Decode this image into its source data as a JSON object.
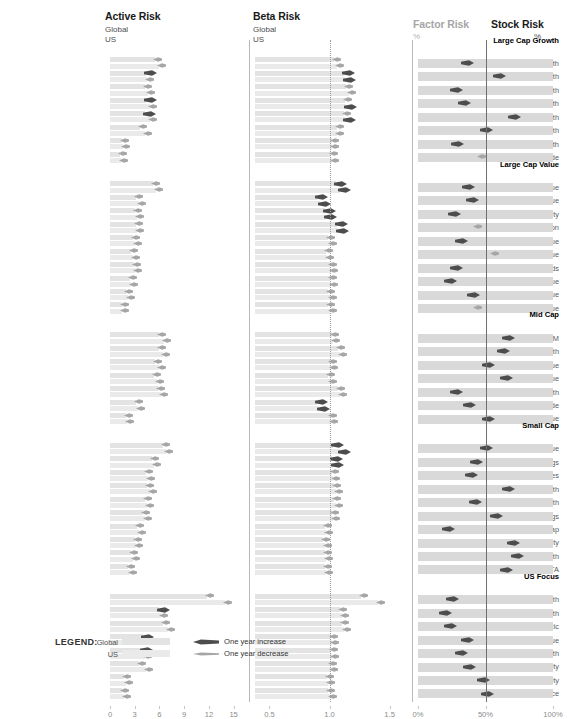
{
  "panels": {
    "active": {
      "title": "Active Risk",
      "sub1": "Global",
      "sub2": "US",
      "ticks": [
        "0",
        "3",
        "6",
        "9",
        "12",
        "15"
      ],
      "min": 0,
      "max": 16.5
    },
    "beta": {
      "title": "Beta Risk",
      "sub1": "Global",
      "sub2": "US",
      "ticks": [
        "0.5",
        "1.0",
        "1.5"
      ],
      "min": 0.38,
      "max": 1.62,
      "refline": 1.0
    },
    "factor": {
      "title": "Factor Risk",
      "sub1": "%"
    },
    "stock": {
      "title": "Stock Risk",
      "sub1": "%",
      "ticks": [
        "0%",
        "50%",
        "100%"
      ]
    }
  },
  "legend": {
    "title": "LEGEND:",
    "global_label": "Global",
    "us_label": "US",
    "increase_label": "One year increase",
    "decrease_label": "One year decrease"
  },
  "colors": {
    "global_bar": "#e3e3e3",
    "us_bar": "#eaeaea",
    "full_bar": "#d9d9d9",
    "increase_marker": "#4d4d4d",
    "decrease_marker": "#a6a6a6",
    "axis": "#8c8c8c"
  },
  "chart_data": {
    "type": "bar",
    "xlabel": "",
    "ylabel": "",
    "axes": [
      {
        "name": "Active Risk",
        "ticks": [
          0,
          3,
          6,
          9,
          12,
          15
        ],
        "range": [
          0,
          16.5
        ],
        "unit": ""
      },
      {
        "name": "Beta Risk",
        "ticks": [
          0.5,
          1.0,
          1.5
        ],
        "range": [
          0.38,
          1.62
        ],
        "unit": "",
        "refline": 1.0
      },
      {
        "name": "Factor Risk / Stock Risk",
        "ticks": [
          0,
          50,
          100
        ],
        "range": [
          0,
          100
        ],
        "unit": "%",
        "split": 50
      }
    ],
    "groups": [
      {
        "name": "Large Cap Growth",
        "rows": [
          {
            "label": "LM Growth",
            "active_global": 5.5,
            "active_us": 5.9,
            "active_g_dir": "dec",
            "active_u_dir": "dec",
            "beta_global": 1.04,
            "beta_us": 1.06,
            "beta_g_dir": "dec",
            "beta_u_dir": "dec",
            "factor": 64,
            "factor_dir": "inc"
          },
          {
            "label": "Controlled US Growth",
            "active_global": 4.4,
            "active_us": 4.5,
            "active_g_dir": "inc",
            "active_u_dir": "dec",
            "beta_global": 1.12,
            "beta_us": 1.13,
            "beta_g_dir": "inc",
            "beta_u_dir": "inc",
            "factor": 40,
            "factor_dir": "inc"
          },
          {
            "label": "Pragmatic Growth",
            "active_global": 4.3,
            "active_us": 4.6,
            "active_g_dir": "dec",
            "active_u_dir": "dec",
            "beta_global": 1.14,
            "beta_us": 1.16,
            "beta_g_dir": "dec",
            "beta_u_dir": "dec",
            "factor": 72,
            "factor_dir": "inc"
          },
          {
            "label": "Merit Growth",
            "active_global": 4.4,
            "active_us": 4.9,
            "active_g_dir": "inc",
            "active_u_dir": "dec",
            "beta_global": 1.13,
            "beta_us": 1.14,
            "beta_g_dir": "dec",
            "beta_u_dir": "inc",
            "factor": 66,
            "factor_dir": "inc"
          },
          {
            "label": "Varied Growth",
            "active_global": 4.3,
            "active_us": 4.8,
            "active_g_dir": "inc",
            "active_u_dir": "dec",
            "beta_global": 1.12,
            "beta_us": 1.13,
            "beta_g_dir": "dec",
            "beta_u_dir": "inc",
            "factor": 29,
            "factor_dir": "inc"
          },
          {
            "label": "Tactical Growth",
            "active_global": 3.7,
            "active_us": 4.3,
            "active_g_dir": "dec",
            "active_u_dir": "dec",
            "beta_global": 1.06,
            "beta_us": 1.06,
            "beta_g_dir": "dec",
            "beta_u_dir": "dec",
            "factor": 50,
            "factor_dir": "inc"
          },
          {
            "label": "Active Growth",
            "active_global": 1.5,
            "active_us": 1.6,
            "active_g_dir": "dec",
            "active_u_dir": "dec",
            "beta_global": 1.02,
            "beta_us": 1.02,
            "beta_g_dir": "dec",
            "beta_u_dir": "dec",
            "factor": 71,
            "factor_dir": "inc"
          },
          {
            "label": "Growth Longitude",
            "active_global": 1.2,
            "active_us": 1.3,
            "active_g_dir": "dec",
            "active_u_dir": "dec",
            "beta_global": 1.01,
            "beta_us": 1.02,
            "beta_g_dir": "dec",
            "beta_u_dir": "dec",
            "factor": 52,
            "factor_dir": "dec"
          }
        ]
      },
      {
        "name": "Large Cap Value",
        "rows": [
          {
            "label": "Merit Value",
            "active_global": 5.2,
            "active_us": 5.6,
            "active_g_dir": "dec",
            "active_u_dir": "dec",
            "beta_global": 1.05,
            "beta_us": 1.09,
            "beta_g_dir": "inc",
            "beta_u_dir": "inc",
            "factor": 63,
            "factor_dir": "inc"
          },
          {
            "label": "Varied Core/Value",
            "active_global": 3.2,
            "active_us": 3.5,
            "active_g_dir": "dec",
            "active_u_dir": "dec",
            "beta_global": 0.9,
            "beta_us": 0.92,
            "beta_g_dir": "inc",
            "beta_u_dir": "inc",
            "factor": 60,
            "factor_dir": "inc"
          },
          {
            "label": "Merit Equity",
            "active_global": 3.0,
            "active_us": 3.3,
            "active_g_dir": "dec",
            "active_u_dir": "dec",
            "beta_global": 0.96,
            "beta_us": 0.97,
            "beta_g_dir": "inc",
            "beta_u_dir": "inc",
            "factor": 73,
            "factor_dir": "inc"
          },
          {
            "label": "DG Capital Appreciation",
            "active_global": 3.1,
            "active_us": 3.3,
            "active_g_dir": "dec",
            "active_u_dir": "dec",
            "beta_global": 1.06,
            "beta_us": 1.07,
            "beta_g_dir": "inc",
            "beta_u_dir": "inc",
            "factor": 55,
            "factor_dir": "dec"
          },
          {
            "label": "Pragmatic Value",
            "active_global": 2.8,
            "active_us": 3.0,
            "active_g_dir": "dec",
            "active_u_dir": "dec",
            "beta_global": 0.99,
            "beta_us": 1.0,
            "beta_g_dir": "dec",
            "beta_u_dir": "dec",
            "factor": 68,
            "factor_dir": "inc"
          },
          {
            "label": "Value",
            "active_global": 2.6,
            "active_us": 2.8,
            "active_g_dir": "dec",
            "active_u_dir": "dec",
            "beta_global": 0.97,
            "beta_us": 0.98,
            "beta_g_dir": "dec",
            "beta_u_dir": "dec",
            "factor": 42,
            "factor_dir": "dec"
          },
          {
            "label": "Value - Dividends",
            "active_global": 2.9,
            "active_us": 3.0,
            "active_g_dir": "dec",
            "active_u_dir": "dec",
            "beta_global": 1.0,
            "beta_us": 1.01,
            "beta_g_dir": "dec",
            "beta_u_dir": "dec",
            "factor": 72,
            "factor_dir": "inc"
          },
          {
            "label": "DG Value",
            "active_global": 2.4,
            "active_us": 2.6,
            "active_g_dir": "dec",
            "active_u_dir": "dec",
            "beta_global": 1.0,
            "beta_us": 1.01,
            "beta_g_dir": "dec",
            "beta_u_dir": "dec",
            "factor": 76,
            "factor_dir": "inc"
          },
          {
            "label": "Controlled US Value",
            "active_global": 2.0,
            "active_us": 2.2,
            "active_g_dir": "dec",
            "active_u_dir": "dec",
            "beta_global": 0.99,
            "beta_us": 1.0,
            "beta_g_dir": "dec",
            "beta_u_dir": "dec",
            "factor": 59,
            "factor_dir": "inc"
          },
          {
            "label": "DG Basic Value",
            "active_global": 1.4,
            "active_us": 1.5,
            "active_g_dir": "dec",
            "active_u_dir": "dec",
            "beta_global": 0.99,
            "beta_us": 1.0,
            "beta_g_dir": "dec",
            "beta_u_dir": "dec",
            "factor": 55,
            "factor_dir": "dec"
          }
        ]
      },
      {
        "name": "Mid Cap",
        "rows": [
          {
            "label": "Mid Cap OM",
            "active_global": 6.0,
            "active_us": 6.5,
            "active_g_dir": "dec",
            "active_u_dir": "dec",
            "beta_global": 1.02,
            "beta_us": 1.03,
            "beta_g_dir": "dec",
            "beta_u_dir": "dec",
            "factor": 33,
            "factor_dir": "inc"
          },
          {
            "label": "Select Mid Cap Growth",
            "active_global": 6.0,
            "active_us": 6.4,
            "active_g_dir": "dec",
            "active_u_dir": "dec",
            "beta_global": 1.07,
            "beta_us": 1.09,
            "beta_g_dir": "dec",
            "beta_u_dir": "dec",
            "factor": 37,
            "factor_dir": "inc"
          },
          {
            "label": "Mid Cap Value",
            "active_global": 5.5,
            "active_us": 5.9,
            "active_g_dir": "dec",
            "active_u_dir": "dec",
            "beta_global": 1.0,
            "beta_us": 1.01,
            "beta_g_dir": "dec",
            "beta_u_dir": "dec",
            "factor": 48,
            "factor_dir": "inc"
          },
          {
            "label": "Select Mid Cap Value",
            "active_global": 5.3,
            "active_us": 5.7,
            "active_g_dir": "dec",
            "active_u_dir": "dec",
            "beta_global": 0.99,
            "beta_us": 1.0,
            "beta_g_dir": "dec",
            "beta_u_dir": "dec",
            "factor": 35,
            "factor_dir": "inc"
          },
          {
            "label": "Mid Cap Growth",
            "active_global": 5.8,
            "active_us": 6.2,
            "active_g_dir": "dec",
            "active_u_dir": "dec",
            "beta_global": 1.07,
            "beta_us": 1.09,
            "beta_g_dir": "dec",
            "beta_u_dir": "dec",
            "factor": 72,
            "factor_dir": "inc"
          },
          {
            "label": "Mid Cap Growth Longitude",
            "active_global": 3.2,
            "active_us": 3.4,
            "active_g_dir": "dec",
            "active_u_dir": "dec",
            "beta_global": 0.9,
            "beta_us": 0.91,
            "beta_g_dir": "inc",
            "beta_u_dir": "inc",
            "factor": 62,
            "factor_dir": "inc"
          },
          {
            "label": "MG Cap Value",
            "active_global": 2.0,
            "active_us": 2.1,
            "active_g_dir": "dec",
            "active_u_dir": "dec",
            "beta_global": 1.0,
            "beta_us": 1.01,
            "beta_g_dir": "dec",
            "beta_u_dir": "dec",
            "factor": 48,
            "factor_dir": "inc"
          }
        ]
      },
      {
        "name": "Small Cap",
        "rows": [
          {
            "label": "Small Cap Value",
            "active_global": 6.4,
            "active_us": 6.8,
            "active_g_dir": "dec",
            "active_u_dir": "dec",
            "beta_global": 1.03,
            "beta_us": 1.09,
            "beta_g_dir": "inc",
            "beta_u_dir": "inc",
            "factor": 50,
            "factor_dir": "inc"
          },
          {
            "label": "Small Cap Openings",
            "active_global": 5.1,
            "active_us": 5.3,
            "active_g_dir": "dec",
            "active_u_dir": "dec",
            "beta_global": 1.02,
            "beta_us": 1.03,
            "beta_g_dir": "inc",
            "beta_u_dir": "inc",
            "factor": 57,
            "factor_dir": "inc"
          },
          {
            "label": "Emerging Companies",
            "active_global": 4.4,
            "active_us": 4.6,
            "active_g_dir": "dec",
            "active_u_dir": "dec",
            "beta_global": 1.02,
            "beta_us": 1.03,
            "beta_g_dir": "dec",
            "beta_u_dir": "dec",
            "factor": 61,
            "factor_dir": "inc"
          },
          {
            "label": "Small Cap Growth",
            "active_global": 4.5,
            "active_us": 4.8,
            "active_g_dir": "dec",
            "active_u_dir": "dec",
            "beta_global": 1.04,
            "beta_us": 1.05,
            "beta_g_dir": "dec",
            "beta_u_dir": "dec",
            "factor": 33,
            "factor_dir": "inc"
          },
          {
            "label": "Select Small Cap Growth",
            "active_global": 4.3,
            "active_us": 4.5,
            "active_g_dir": "dec",
            "active_u_dir": "dec",
            "beta_global": 1.04,
            "beta_us": 1.05,
            "beta_g_dir": "dec",
            "beta_u_dir": "dec",
            "factor": 58,
            "factor_dir": "inc"
          },
          {
            "label": "Small Cap Openings",
            "active_global": 4.0,
            "active_us": 4.2,
            "active_g_dir": "dec",
            "active_u_dir": "dec",
            "beta_global": 1.02,
            "beta_us": 1.03,
            "beta_g_dir": "dec",
            "beta_u_dir": "dec",
            "factor": 42,
            "factor_dir": "inc"
          },
          {
            "label": "SW Micro Cap",
            "active_global": 3.3,
            "active_us": 3.5,
            "active_g_dir": "dec",
            "active_u_dir": "dec",
            "beta_global": 0.96,
            "beta_us": 0.97,
            "beta_g_dir": "dec",
            "beta_u_dir": "dec",
            "factor": 78,
            "factor_dir": "inc"
          },
          {
            "label": "Controlled Small Cap Equity",
            "active_global": 3.0,
            "active_us": 3.2,
            "active_g_dir": "dec",
            "active_u_dir": "dec",
            "beta_global": 0.95,
            "beta_us": 0.96,
            "beta_g_dir": "dec",
            "beta_u_dir": "dec",
            "factor": 30,
            "factor_dir": "inc"
          },
          {
            "label": "US Small Cap Growth",
            "active_global": 2.6,
            "active_us": 2.8,
            "active_g_dir": "dec",
            "active_u_dir": "dec",
            "beta_global": 0.96,
            "beta_us": 0.97,
            "beta_g_dir": "dec",
            "beta_u_dir": "dec",
            "factor": 27,
            "factor_dir": "inc"
          },
          {
            "label": "US Smaller Cap TA",
            "active_global": 2.2,
            "active_us": 2.4,
            "active_g_dir": "dec",
            "active_u_dir": "dec",
            "beta_global": 0.96,
            "beta_us": 0.97,
            "beta_g_dir": "dec",
            "beta_u_dir": "dec",
            "factor": 35,
            "factor_dir": "inc"
          }
        ]
      },
      {
        "name": "US Focus",
        "rows": [
          {
            "label": "Choice Growth",
            "active_global": 11.8,
            "active_us": 14.0,
            "active_g_dir": "dec",
            "active_u_dir": "dec",
            "beta_global": 1.26,
            "beta_us": 1.4,
            "beta_g_dir": "dec",
            "beta_u_dir": "dec",
            "factor": 75,
            "factor_dir": "inc"
          },
          {
            "label": "Choice Value Growth",
            "active_global": 6.0,
            "active_us": 6.2,
            "active_g_dir": "inc",
            "active_u_dir": "dec",
            "beta_global": 1.09,
            "beta_us": 1.1,
            "beta_g_dir": "dec",
            "beta_u_dir": "dec",
            "factor": 80,
            "factor_dir": "inc"
          },
          {
            "label": "All Cap Pragmatic",
            "active_global": 6.4,
            "active_us": 7.0,
            "active_g_dir": "dec",
            "active_u_dir": "dec",
            "beta_global": 1.1,
            "beta_us": 1.12,
            "beta_g_dir": "dec",
            "beta_u_dir": "dec",
            "factor": 76,
            "factor_dir": "inc"
          },
          {
            "label": "Choice Intrinsic Value",
            "active_global": 4.0,
            "active_us": 4.3,
            "active_g_dir": "inc",
            "active_u_dir": "dec",
            "beta_global": 1.01,
            "beta_us": 1.02,
            "beta_g_dir": "dec",
            "beta_u_dir": "dec",
            "factor": 64,
            "factor_dir": "inc"
          },
          {
            "label": "CM Specialty Growth",
            "active_global": 3.9,
            "active_us": 4.3,
            "active_g_dir": "inc",
            "active_u_dir": "dec",
            "beta_global": 1.01,
            "beta_us": 1.02,
            "beta_g_dir": "dec",
            "beta_u_dir": "dec",
            "factor": 68,
            "factor_dir": "inc"
          },
          {
            "label": "Focused Equity",
            "active_global": 3.5,
            "active_us": 4.4,
            "active_g_dir": "dec",
            "active_u_dir": "dec",
            "beta_global": 1.0,
            "beta_us": 1.01,
            "beta_g_dir": "dec",
            "beta_u_dir": "dec",
            "factor": 62,
            "factor_dir": "inc"
          },
          {
            "label": "Choice Merit Equity",
            "active_global": 1.7,
            "active_us": 1.9,
            "active_g_dir": "dec",
            "active_u_dir": "dec",
            "beta_global": 0.98,
            "beta_us": 0.99,
            "beta_g_dir": "dec",
            "beta_u_dir": "dec",
            "factor": 52,
            "factor_dir": "inc"
          },
          {
            "label": "CM Choice",
            "active_global": 1.5,
            "active_us": 1.7,
            "active_g_dir": "dec",
            "active_u_dir": "dec",
            "beta_global": 0.99,
            "beta_us": 1.0,
            "beta_g_dir": "dec",
            "beta_u_dir": "dec",
            "factor": 49,
            "factor_dir": "inc"
          }
        ]
      }
    ]
  }
}
